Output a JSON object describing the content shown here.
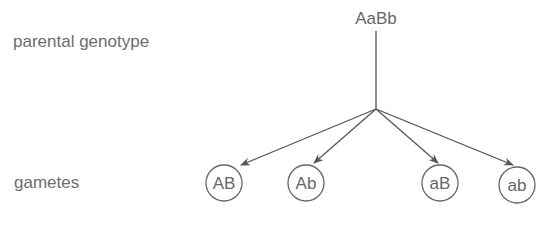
{
  "row_labels": {
    "parental": "parental genotype",
    "gametes": "gametes"
  },
  "parent": {
    "genotype": "AaBb"
  },
  "gametes": [
    {
      "label": "AB"
    },
    {
      "label": "Ab"
    },
    {
      "label": "aB"
    },
    {
      "label": "ab"
    }
  ],
  "colors": {
    "line": "#555555",
    "text": "#666666"
  }
}
